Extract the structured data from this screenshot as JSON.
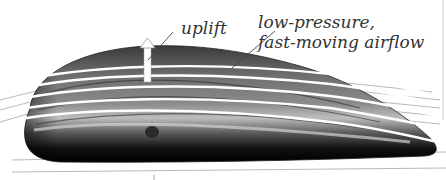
{
  "figure": {
    "labels": {
      "uplift": "uplift",
      "airflow_line1": "low-pressure,",
      "airflow_line2": "fast-moving airflow"
    },
    "colors": {
      "background": "#ffffff",
      "wing_dark": "#111111",
      "wing_mid": "#6a6a6a",
      "wing_light": "#b5b5b5",
      "flow_lines": "#ffffff",
      "leader_lines": "#444444",
      "text": "#333333"
    }
  }
}
